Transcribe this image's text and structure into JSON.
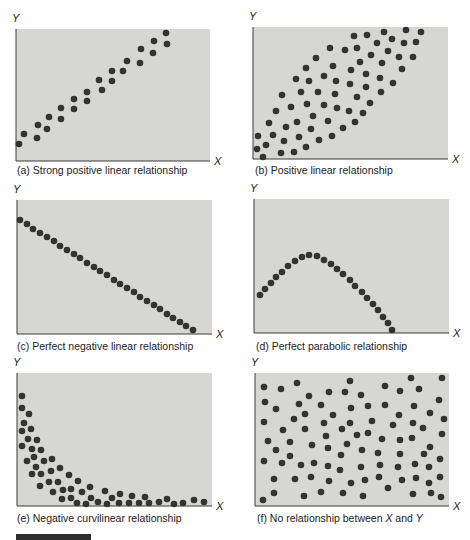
{
  "figure": {
    "background": "#ffffff",
    "panel_fill": "#d6d6d4",
    "dot_color": "#333333"
  },
  "chart_data": [
    {
      "id": "a",
      "type": "scatter",
      "title": "(a) Strong positive linear relationship",
      "xlabel": "X",
      "ylabel": "Y",
      "box": [
        16,
        29,
        210,
        161
      ],
      "caption_pos": [
        17,
        174
      ],
      "points": [
        [
          19,
          144
        ],
        [
          24,
          134
        ],
        [
          37,
          138
        ],
        [
          38,
          125
        ],
        [
          47,
          129
        ],
        [
          49,
          117
        ],
        [
          61,
          119
        ],
        [
          61,
          108
        ],
        [
          74,
          109
        ],
        [
          74,
          99
        ],
        [
          87,
          101
        ],
        [
          87,
          92
        ],
        [
          99,
          80
        ],
        [
          102,
          90
        ],
        [
          112,
          81
        ],
        [
          112,
          71
        ],
        [
          123,
          71
        ],
        [
          127,
          61
        ],
        [
          140,
          63
        ],
        [
          141,
          49
        ],
        [
          153,
          53
        ],
        [
          154,
          41
        ],
        [
          166,
          33
        ],
        [
          167,
          44
        ]
      ]
    },
    {
      "id": "b",
      "type": "scatter",
      "title": "(b) Positive linear relationship",
      "xlabel": "X",
      "ylabel": "Y",
      "box": [
        253,
        27,
        448,
        159
      ],
      "caption_pos": [
        255,
        174
      ],
      "points": [
        [
          258,
          136
        ],
        [
          266,
          145
        ],
        [
          257,
          149
        ],
        [
          263,
          157
        ],
        [
          269,
          123
        ],
        [
          273,
          135
        ],
        [
          276,
          111
        ],
        [
          282,
          95
        ],
        [
          286,
          127
        ],
        [
          284,
          141
        ],
        [
          281,
          153
        ],
        [
          291,
          107
        ],
        [
          294,
          152
        ],
        [
          297,
          122
        ],
        [
          299,
          137
        ],
        [
          296,
          79
        ],
        [
          301,
          92
        ],
        [
          306,
          68
        ],
        [
          306,
          147
        ],
        [
          309,
          81
        ],
        [
          307,
          104
        ],
        [
          311,
          129
        ],
        [
          313,
          116
        ],
        [
          316,
          58
        ],
        [
          318,
          92
        ],
        [
          319,
          140
        ],
        [
          324,
          105
        ],
        [
          324,
          76
        ],
        [
          328,
          121
        ],
        [
          330,
          48
        ],
        [
          333,
          66
        ],
        [
          332,
          136
        ],
        [
          336,
          81
        ],
        [
          335,
          94
        ],
        [
          337,
          108
        ],
        [
          343,
          128
        ],
        [
          345,
          50
        ],
        [
          349,
          111
        ],
        [
          350,
          84
        ],
        [
          351,
          70
        ],
        [
          354,
          36
        ],
        [
          355,
          122
        ],
        [
          357,
          48
        ],
        [
          357,
          97
        ],
        [
          360,
          62
        ],
        [
          363,
          113
        ],
        [
          366,
          74
        ],
        [
          366,
          87
        ],
        [
          367,
          35
        ],
        [
          370,
          103
        ],
        [
          371,
          55
        ],
        [
          377,
          43
        ],
        [
          380,
          78
        ],
        [
          382,
          63
        ],
        [
          381,
          92
        ],
        [
          384,
          32
        ],
        [
          388,
          51
        ],
        [
          392,
          39
        ],
        [
          393,
          83
        ],
        [
          399,
          57
        ],
        [
          402,
          69
        ],
        [
          404,
          43
        ],
        [
          406,
          30
        ],
        [
          413,
          57
        ],
        [
          416,
          42
        ],
        [
          421,
          32
        ]
      ]
    },
    {
      "id": "c",
      "type": "scatter",
      "title": "(c) Perfect negative linear relationship",
      "xlabel": "X",
      "ylabel": "Y",
      "box": [
        17,
        200,
        212,
        334
      ],
      "caption_pos": [
        17,
        350
      ],
      "points": [
        [
          20,
          220
        ],
        [
          27,
          224
        ],
        [
          33,
          229
        ],
        [
          40,
          233
        ],
        [
          47,
          237
        ],
        [
          54,
          241
        ],
        [
          60,
          246
        ],
        [
          67,
          250
        ],
        [
          74,
          254
        ],
        [
          80,
          258
        ],
        [
          87,
          263
        ],
        [
          94,
          267
        ],
        [
          100,
          271
        ],
        [
          107,
          275
        ],
        [
          114,
          280
        ],
        [
          120,
          284
        ],
        [
          127,
          288
        ],
        [
          134,
          292
        ],
        [
          140,
          297
        ],
        [
          147,
          301
        ],
        [
          154,
          305
        ],
        [
          160,
          309
        ],
        [
          167,
          314
        ],
        [
          173,
          318
        ],
        [
          180,
          322
        ],
        [
          186,
          326
        ],
        [
          193,
          330
        ]
      ]
    },
    {
      "id": "d",
      "type": "scatter",
      "title": "(d) Perfect parabolic relationship",
      "xlabel": "X",
      "ylabel": "Y",
      "box": [
        254,
        199,
        449,
        333
      ],
      "caption_pos": [
        256,
        350
      ],
      "points": [
        [
          260,
          295
        ],
        [
          265,
          289
        ],
        [
          271,
          283
        ],
        [
          276,
          277
        ],
        [
          282,
          272
        ],
        [
          288,
          266
        ],
        [
          295,
          261
        ],
        [
          302,
          257
        ],
        [
          309,
          255
        ],
        [
          317,
          256
        ],
        [
          324,
          260
        ],
        [
          331,
          264
        ],
        [
          337,
          269
        ],
        [
          343,
          274
        ],
        [
          350,
          280
        ],
        [
          355,
          286
        ],
        [
          362,
          292
        ],
        [
          367,
          298
        ],
        [
          373,
          304
        ],
        [
          378,
          310
        ],
        [
          383,
          317
        ],
        [
          388,
          323
        ],
        [
          392,
          330
        ]
      ]
    },
    {
      "id": "e",
      "type": "scatter",
      "title": "(e) Negative curvilinear relationship",
      "xlabel": "X",
      "ylabel": "Y",
      "box": [
        17,
        373,
        212,
        506
      ],
      "caption_pos": [
        17,
        522
      ],
      "points": [
        [
          22,
          396
        ],
        [
          22,
          408
        ],
        [
          29,
          414
        ],
        [
          24,
          423
        ],
        [
          22,
          431
        ],
        [
          31,
          429
        ],
        [
          28,
          439
        ],
        [
          37,
          440
        ],
        [
          22,
          446
        ],
        [
          32,
          449
        ],
        [
          41,
          450
        ],
        [
          27,
          461
        ],
        [
          34,
          457
        ],
        [
          44,
          461
        ],
        [
          52,
          459
        ],
        [
          36,
          467
        ],
        [
          32,
          474
        ],
        [
          41,
          474
        ],
        [
          51,
          471
        ],
        [
          60,
          468
        ],
        [
          40,
          486
        ],
        [
          49,
          482
        ],
        [
          58,
          482
        ],
        [
          69,
          475
        ],
        [
          53,
          492
        ],
        [
          63,
          490
        ],
        [
          71,
          489
        ],
        [
          78,
          481
        ],
        [
          62,
          499
        ],
        [
          71,
          498
        ],
        [
          82,
          492
        ],
        [
          90,
          487
        ],
        [
          77,
          503
        ],
        [
          86,
          504
        ],
        [
          91,
          498
        ],
        [
          98,
          502
        ],
        [
          105,
          491
        ],
        [
          107,
          504
        ],
        [
          112,
          498
        ],
        [
          120,
          494
        ],
        [
          119,
          503
        ],
        [
          129,
          503
        ],
        [
          132,
          496
        ],
        [
          139,
          503
        ],
        [
          145,
          497
        ],
        [
          149,
          503
        ],
        [
          159,
          502
        ],
        [
          167,
          499
        ],
        [
          174,
          504
        ],
        [
          183,
          503
        ],
        [
          194,
          500
        ],
        [
          204,
          502
        ]
      ]
    },
    {
      "id": "f",
      "type": "scatter",
      "title_prefix": "(f) No relationship between ",
      "title_x": "X",
      "title_mid": " and ",
      "title_y": "Y",
      "xlabel": "X",
      "ylabel": "Y",
      "box": [
        255,
        373,
        449,
        506
      ],
      "caption_pos": [
        257,
        522
      ],
      "points": [
        [
          264,
          387
        ],
        [
          281,
          389
        ],
        [
          297,
          383
        ],
        [
          309,
          396
        ],
        [
          329,
          392
        ],
        [
          345,
          392
        ],
        [
          350,
          381
        ],
        [
          361,
          395
        ],
        [
          385,
          386
        ],
        [
          400,
          391
        ],
        [
          411,
          378
        ],
        [
          419,
          389
        ],
        [
          442,
          378
        ],
        [
          439,
          400
        ],
        [
          265,
          402
        ],
        [
          276,
          409
        ],
        [
          299,
          404
        ],
        [
          321,
          405
        ],
        [
          351,
          408
        ],
        [
          368,
          406
        ],
        [
          385,
          405
        ],
        [
          414,
          406
        ],
        [
          430,
          413
        ],
        [
          444,
          419
        ],
        [
          264,
          422
        ],
        [
          294,
          419
        ],
        [
          305,
          414
        ],
        [
          333,
          415
        ],
        [
          324,
          423
        ],
        [
          350,
          423
        ],
        [
          372,
          421
        ],
        [
          399,
          415
        ],
        [
          393,
          425
        ],
        [
          413,
          423
        ],
        [
          423,
          428
        ],
        [
          283,
          430
        ],
        [
          305,
          429
        ],
        [
          342,
          429
        ],
        [
          326,
          436
        ],
        [
          357,
          435
        ],
        [
          368,
          433
        ],
        [
          382,
          439
        ],
        [
          400,
          440
        ],
        [
          412,
          438
        ],
        [
          442,
          434
        ],
        [
          268,
          441
        ],
        [
          290,
          442
        ],
        [
          276,
          450
        ],
        [
          312,
          445
        ],
        [
          328,
          448
        ],
        [
          347,
          444
        ],
        [
          362,
          450
        ],
        [
          378,
          453
        ],
        [
          400,
          454
        ],
        [
          430,
          447
        ],
        [
          424,
          454
        ],
        [
          264,
          461
        ],
        [
          282,
          463
        ],
        [
          290,
          456
        ],
        [
          301,
          465
        ],
        [
          314,
          463
        ],
        [
          328,
          466
        ],
        [
          341,
          455
        ],
        [
          340,
          470
        ],
        [
          361,
          467
        ],
        [
          380,
          465
        ],
        [
          398,
          467
        ],
        [
          415,
          464
        ],
        [
          429,
          467
        ],
        [
          440,
          459
        ],
        [
          274,
          479
        ],
        [
          295,
          479
        ],
        [
          311,
          477
        ],
        [
          329,
          481
        ],
        [
          351,
          483
        ],
        [
          365,
          480
        ],
        [
          379,
          477
        ],
        [
          402,
          480
        ],
        [
          416,
          478
        ],
        [
          429,
          483
        ],
        [
          440,
          477
        ],
        [
          263,
          500
        ],
        [
          274,
          493
        ],
        [
          304,
          496
        ],
        [
          321,
          492
        ],
        [
          343,
          493
        ],
        [
          363,
          496
        ],
        [
          388,
          488
        ],
        [
          413,
          494
        ],
        [
          431,
          493
        ],
        [
          441,
          497
        ]
      ]
    }
  ]
}
